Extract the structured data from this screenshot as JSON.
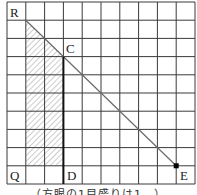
{
  "figure": {
    "grid": {
      "columns": 10,
      "rows": 10
    },
    "points": {
      "R": {
        "label": "R",
        "col": 1,
        "row": 1
      },
      "C": {
        "label": "C",
        "col": 3,
        "row": 3
      },
      "E": {
        "label": "E",
        "col": 9,
        "row": 9
      },
      "Q": {
        "label": "Q"
      },
      "D": {
        "label": "D"
      }
    },
    "segments": [
      {
        "name": "diagonal-RE",
        "from": "R",
        "to": "E"
      },
      {
        "name": "segment-CD",
        "from": "C",
        "to": "D"
      }
    ],
    "shaded_region": "hatched quadrilateral under segment RC, left of segment CD",
    "colors": {
      "grid": "#3a3a3a",
      "diagonal": "#6a6a6a",
      "thick_line": "#111111",
      "hatch": "#9a9a9a",
      "dot": "#000000"
    }
  },
  "caption": "（方眼の1目盛りは1　）"
}
